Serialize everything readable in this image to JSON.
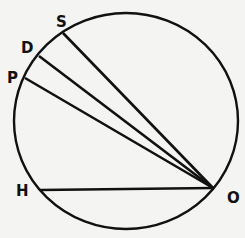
{
  "diagram": {
    "type": "circle-with-chords",
    "colors": {
      "background": "#f4f4f2",
      "stroke": "#111111"
    },
    "circle": {
      "cx": 126,
      "cy": 121,
      "rx": 112,
      "ry": 108
    },
    "vertex": {
      "label": "O",
      "x": 213,
      "y": 188,
      "label_x": 227,
      "label_y": 203
    },
    "points": [
      {
        "label": "S",
        "x": 63,
        "y": 33,
        "label_x": 56,
        "label_y": 27
      },
      {
        "label": "D",
        "x": 39,
        "y": 56,
        "label_x": 21,
        "label_y": 53
      },
      {
        "label": "P",
        "x": 25,
        "y": 78,
        "label_x": 7,
        "label_y": 83
      },
      {
        "label": "H",
        "x": 40,
        "y": 190,
        "label_x": 16,
        "label_y": 196
      }
    ]
  }
}
